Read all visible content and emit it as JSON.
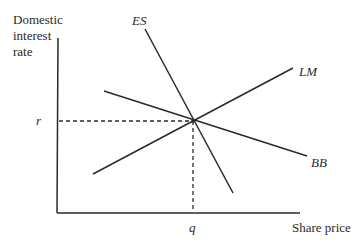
{
  "diagram": {
    "y_axis_label": [
      "Domestic",
      "interest",
      "rate"
    ],
    "x_axis_label": "Share price",
    "curves": {
      "es": "ES",
      "lm": "LM",
      "bb": "BB"
    },
    "equilibrium": {
      "r_label": "r",
      "q_label": "q"
    },
    "colors": {
      "line": "#2a2a2a"
    }
  }
}
